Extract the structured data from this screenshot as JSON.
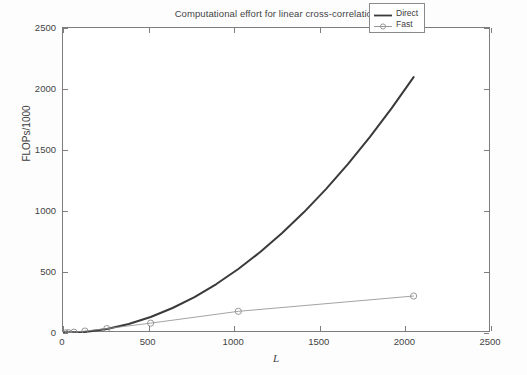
{
  "chart_data": {
    "type": "line",
    "title": "Computational effort for linear cross-correlation",
    "xlabel": "L",
    "ylabel": "FLOPs/1000",
    "xlim": [
      0,
      2500
    ],
    "ylim": [
      0,
      2500
    ],
    "xticks": [
      0,
      500,
      1000,
      1500,
      2000,
      2500
    ],
    "yticks": [
      0,
      500,
      1000,
      1500,
      2000,
      2500
    ],
    "grid": false,
    "legend_position": "top-right",
    "series": [
      {
        "name": "Direct",
        "style": "solid-thick",
        "marker": "none",
        "color": "#3a3a3a",
        "x": [
          0,
          16,
          32,
          64,
          128,
          256,
          512,
          1024,
          2048
        ],
        "y": [
          0,
          0.5,
          2.0,
          8.2,
          32.8,
          131,
          524,
          2097,
          2097
        ],
        "curve_x": [
          0,
          128,
          256,
          384,
          512,
          640,
          768,
          896,
          1024,
          1152,
          1280,
          1408,
          1536,
          1664,
          1792,
          1920,
          2048
        ],
        "curve_y": [
          0,
          8.2,
          32.8,
          73.7,
          131,
          204.8,
          294.9,
          401.4,
          524.3,
          663.6,
          819.2,
          991.2,
          1179.6,
          1384.4,
          1605.6,
          1843.2,
          2097.2
        ]
      },
      {
        "name": "Fast",
        "style": "solid-thin",
        "marker": "circle",
        "color": "#8c8c8c",
        "x": [
          16,
          32,
          64,
          128,
          256,
          512,
          1024,
          2048
        ],
        "y": [
          1.2,
          2.9,
          6.9,
          16.0,
          36.2,
          80.7,
          177.6,
          303.0
        ]
      }
    ],
    "legend": [
      {
        "label": "Direct"
      },
      {
        "label": "Fast"
      }
    ]
  },
  "axis": {
    "x_tick_labels": [
      "0",
      "500",
      "1000",
      "1500",
      "2000",
      "2500"
    ],
    "y_tick_labels": [
      "0",
      "500",
      "1000",
      "1500",
      "2000",
      "2500"
    ]
  },
  "colors": {
    "direct_line": "#3a3a3a",
    "fast_line": "#8c8c8c",
    "axis": "#7d7d7d",
    "text": "#3d3d3d",
    "background": "#ffffff"
  }
}
